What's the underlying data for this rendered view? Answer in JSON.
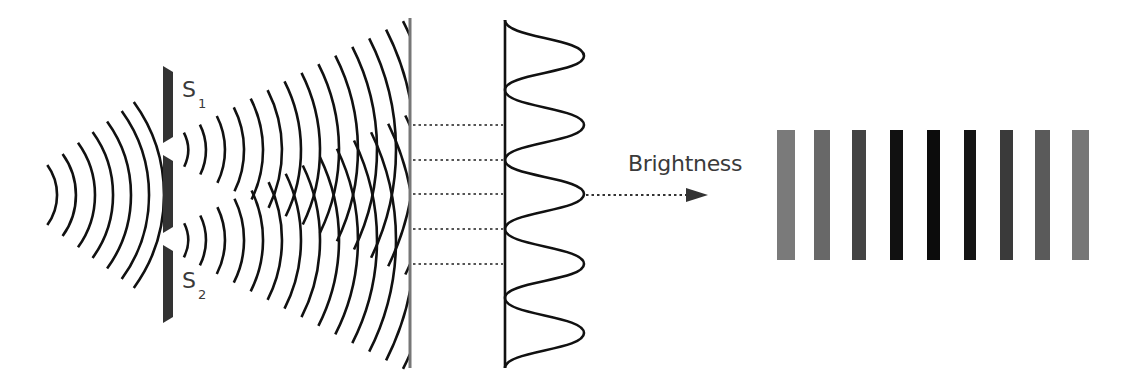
{
  "figure": {
    "background": "#ffffff"
  },
  "labels": {
    "slit1": {
      "letter": "S",
      "sub": "1"
    },
    "slit2": {
      "letter": "S",
      "sub": "2"
    },
    "brightness": "Brightness"
  },
  "source_waves": {
    "center": [
      6,
      195
    ],
    "radii": [
      51,
      70,
      89,
      107,
      125,
      143,
      158
    ],
    "angle_deg": 36,
    "color": "#111111",
    "stroke_width": 2.6
  },
  "barrier": {
    "x": 163,
    "width": 10,
    "color": "#333333",
    "segments": [
      [
        66,
        143
      ],
      [
        155,
        233
      ],
      [
        245,
        323
      ]
    ],
    "slits": [
      {
        "name": "S1",
        "y": 149
      },
      {
        "name": "S2",
        "y": 239
      }
    ]
  },
  "slit_waves": {
    "color": "#111111",
    "stroke_width": 2.6,
    "clip_x": 409,
    "sources": [
      {
        "center": [
          150,
          150
        ],
        "from_deg": -27,
        "to_deg": 26
      },
      {
        "center": [
          150,
          240
        ],
        "from_deg": -26,
        "to_deg": 27
      }
    ],
    "radii": [
      38,
      56,
      75,
      94,
      113,
      132,
      151,
      170,
      189,
      208,
      227,
      246,
      265,
      284
    ]
  },
  "screen": {
    "x": 410,
    "y1": 18,
    "y2": 368,
    "width": 3,
    "color": "#777777"
  },
  "projection_lines": {
    "x1": 413,
    "x2": 503,
    "ys": [
      125,
      160,
      194,
      229,
      264
    ],
    "color": "#555555"
  },
  "intensity_curve": {
    "baseline_x": 505,
    "peak_x": 584,
    "y_start": 20,
    "y_end": 368,
    "peaks_y": [
      56,
      125,
      194,
      264,
      333
    ],
    "troughs_y": [
      90,
      160,
      229,
      298
    ],
    "color": "#111111"
  },
  "brightness_arrow": {
    "x1": 586,
    "x2": 686,
    "y": 195,
    "head_x": 708,
    "head_half_height": 7,
    "color": "#333333"
  },
  "fringes": {
    "y_top": 130,
    "y_bottom": 260,
    "bars": [
      {
        "x": 777,
        "w": 18,
        "color": "#7a7a7a"
      },
      {
        "x": 814,
        "w": 16,
        "color": "#686868"
      },
      {
        "x": 852,
        "w": 14,
        "color": "#444444"
      },
      {
        "x": 890,
        "w": 13,
        "color": "#111111"
      },
      {
        "x": 927,
        "w": 13,
        "color": "#0c0c0c"
      },
      {
        "x": 964,
        "w": 12,
        "color": "#151515"
      },
      {
        "x": 1000,
        "w": 13,
        "color": "#3a3a3a"
      },
      {
        "x": 1035,
        "w": 15,
        "color": "#5a5a5a"
      },
      {
        "x": 1072,
        "w": 17,
        "color": "#777777"
      }
    ]
  }
}
